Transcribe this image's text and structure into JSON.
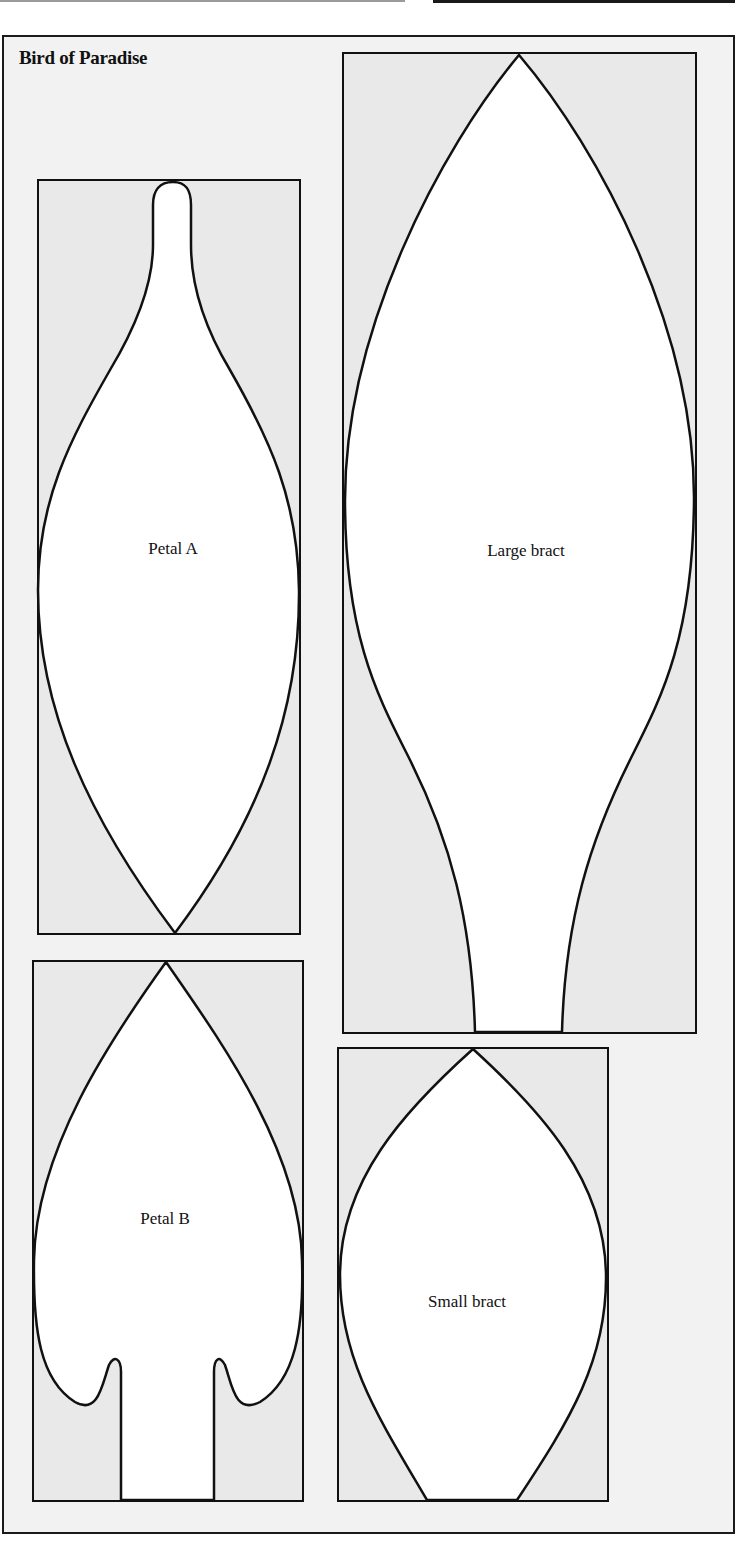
{
  "title": "Bird of Paradise",
  "colors": {
    "sheet_background": "#f2f2f2",
    "template_box_fill": "#e9e9e9",
    "shape_fill": "#ffffff",
    "outline": "#111111"
  },
  "templates": [
    {
      "id": "petal-a",
      "label": "Petal A"
    },
    {
      "id": "large-bract",
      "label": "Large bract"
    },
    {
      "id": "petal-b",
      "label": "Petal B"
    },
    {
      "id": "small-bract",
      "label": "Small bract"
    }
  ]
}
